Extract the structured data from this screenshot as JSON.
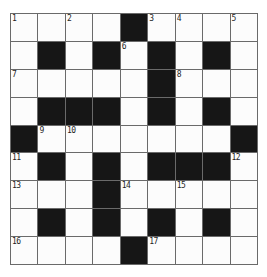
{
  "puzzle": {
    "name": "crossword-grid",
    "rows": 9,
    "cols": 9,
    "cells": [
      [
        {
          "n": "1"
        },
        {},
        {
          "n": "2"
        },
        {},
        {
          "b": 1
        },
        {
          "n": "3"
        },
        {
          "n": "4"
        },
        {},
        {
          "n": "5"
        }
      ],
      [
        {},
        {
          "b": 1
        },
        {},
        {
          "b": 1
        },
        {
          "n": "6"
        },
        {
          "b": 1
        },
        {},
        {
          "b": 1
        },
        {}
      ],
      [
        {
          "n": "7"
        },
        {},
        {},
        {},
        {},
        {
          "b": 1
        },
        {
          "n": "8"
        },
        {},
        {}
      ],
      [
        {},
        {
          "b": 1
        },
        {
          "b": 1
        },
        {
          "b": 1
        },
        {},
        {
          "b": 1
        },
        {},
        {
          "b": 1
        },
        {}
      ],
      [
        {
          "b": 1
        },
        {
          "n": "9"
        },
        {
          "n": "10"
        },
        {},
        {},
        {},
        {},
        {},
        {
          "b": 1
        }
      ],
      [
        {
          "n": "11"
        },
        {
          "b": 1
        },
        {},
        {
          "b": 1
        },
        {},
        {
          "b": 1
        },
        {
          "b": 1
        },
        {
          "b": 1
        },
        {
          "n": "12"
        }
      ],
      [
        {
          "n": "13"
        },
        {},
        {},
        {
          "b": 1
        },
        {
          "n": "14"
        },
        {},
        {
          "n": "15"
        },
        {},
        {}
      ],
      [
        {},
        {
          "b": 1
        },
        {},
        {
          "b": 1
        },
        {},
        {
          "b": 1
        },
        {},
        {
          "b": 1
        },
        {}
      ],
      [
        {
          "n": "16"
        },
        {},
        {},
        {},
        {
          "b": 1
        },
        {
          "n": "17"
        },
        {},
        {},
        {}
      ]
    ]
  },
  "colors": {
    "background": "#ffffff",
    "grid_line": "#6a6a6a",
    "white_cell": "#fcfcfc",
    "black_cell": "#161616",
    "number_text": "#1f1f1f"
  }
}
